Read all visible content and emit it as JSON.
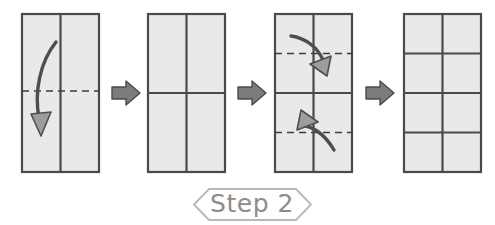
{
  "diagram": {
    "title": "Step 2",
    "caption_label": "Step 2",
    "type": "origami-folding-instruction",
    "panel_count": 4,
    "transition_arrow_count": 3,
    "colors": {
      "paper_fill": "#e9e9e9",
      "paper_border": "#4a4a4a",
      "crease_solid": "#4a4a4a",
      "crease_dashed": "#3c3c3c",
      "fold_arrow_stroke": "#4e4e4e",
      "fold_arrow_head_fill": "#9d9d9d",
      "transition_arrow_fill": "#7c7c7c",
      "banner_stroke": "#b8b8b8",
      "banner_text": "#8c8c8c",
      "background": "#ffffff"
    },
    "panels": [
      {
        "id": "panel-1",
        "name": "vertical-rectangle-with-center-fold",
        "description": "Tall rectangle divided by one vertical center crease, with a horizontal dashed fold line across the middle and a curved arrow folding the top half downward.",
        "columns": 2,
        "rows": 1,
        "vertical_creases": [
          "solid-center"
        ],
        "horizontal_creases": [
          "dashed-middle"
        ],
        "fold_arrows": [
          {
            "name": "fold-top-down-arrow",
            "direction": "down",
            "from": "top-left",
            "to": "bottom-left"
          }
        ]
      },
      {
        "id": "panel-2",
        "name": "quartered-rectangle",
        "description": "Tall rectangle creased into a two-by-two grid of four equal panels, all creases solid.",
        "columns": 2,
        "rows": 2,
        "vertical_creases": [
          "solid-center"
        ],
        "horizontal_creases": [
          "solid-middle"
        ],
        "fold_arrows": []
      },
      {
        "id": "panel-3",
        "name": "quarter-folds-toward-center",
        "description": "Two-by-two creased rectangle with dashed fold lines at the upper quarter and lower quarter, and two curved arrows folding the top edge and bottom edge in toward the horizontal center.",
        "columns": 2,
        "rows": 2,
        "vertical_creases": [
          "solid-center"
        ],
        "horizontal_creases": [
          "solid-middle",
          "dashed-upper-quarter",
          "dashed-lower-quarter"
        ],
        "fold_arrows": [
          {
            "name": "fold-top-edge-to-center-arrow",
            "direction": "down-right",
            "from": "upper-left",
            "to": "upper-center"
          },
          {
            "name": "fold-bottom-edge-to-center-arrow",
            "direction": "up-left",
            "from": "lower-right",
            "to": "lower-center"
          }
        ]
      },
      {
        "id": "panel-4",
        "name": "eight-cell-grid-result",
        "description": "Finished result: tall rectangle creased into a two column by four row grid of eight equal cells.",
        "columns": 2,
        "rows": 4,
        "vertical_creases": [
          "solid-center"
        ],
        "horizontal_creases": [
          "solid-quarter",
          "solid-middle",
          "solid-three-quarter"
        ],
        "fold_arrows": []
      }
    ],
    "transition_arrows": [
      {
        "id": "transition-arrow-1",
        "name": "transition-arrow-panel1-to-panel2",
        "direction": "right"
      },
      {
        "id": "transition-arrow-2",
        "name": "transition-arrow-panel2-to-panel3",
        "direction": "right"
      },
      {
        "id": "transition-arrow-3",
        "name": "transition-arrow-panel3-to-panel4",
        "direction": "right"
      }
    ]
  }
}
